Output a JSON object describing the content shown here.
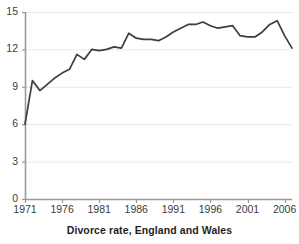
{
  "caption": "Divorce rate, England and Wales",
  "colors": {
    "line": "#3d3d3d",
    "axis": "#9a9a9a",
    "grid": "#e8e8e8",
    "text": "#3b3b3b",
    "background": "#ffffff"
  },
  "chart_data": {
    "type": "line",
    "title": "",
    "subtitle": "",
    "xlabel": "Divorce rate, England and Wales",
    "ylabel": "",
    "xlim": [
      1971,
      2007
    ],
    "ylim": [
      0,
      15
    ],
    "grid": true,
    "legend": "none",
    "xticks": [
      "1971",
      "1976",
      "1981",
      "1986",
      "1991",
      "1996",
      "2001",
      "2006"
    ],
    "xtick_values": [
      1971,
      1976,
      1981,
      1986,
      1991,
      1996,
      2001,
      2006
    ],
    "yticks": [
      "0",
      "3",
      "6",
      "9",
      "12",
      "15"
    ],
    "ytick_values": [
      0,
      3,
      6,
      9,
      12,
      15
    ],
    "series": [
      {
        "name": "Divorce rate",
        "x": [
          1971,
          1972,
          1973,
          1974,
          1975,
          1976,
          1977,
          1978,
          1979,
          1980,
          1981,
          1982,
          1983,
          1984,
          1985,
          1986,
          1987,
          1988,
          1989,
          1990,
          1991,
          1992,
          1993,
          1994,
          1995,
          1996,
          1997,
          1998,
          1999,
          2000,
          2001,
          2002,
          2003,
          2004,
          2005,
          2006,
          2007
        ],
        "values": [
          6.0,
          9.5,
          8.7,
          9.2,
          9.7,
          10.1,
          10.4,
          11.6,
          11.2,
          12.0,
          11.9,
          12.0,
          12.2,
          12.1,
          13.3,
          12.9,
          12.8,
          12.8,
          12.7,
          13.0,
          13.4,
          13.7,
          14.0,
          14.0,
          14.2,
          13.9,
          13.7,
          13.8,
          13.9,
          13.1,
          13.0,
          13.0,
          13.4,
          14.0,
          14.3,
          13.1,
          12.1
        ]
      }
    ]
  },
  "geometry": {
    "plot_left": 25,
    "plot_right": 292,
    "plot_top": 12,
    "plot_bottom": 199
  }
}
